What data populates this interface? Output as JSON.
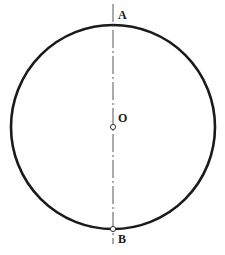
{
  "diagram": {
    "type": "circle-with-diameter",
    "circle": {
      "cx": 113,
      "cy": 127,
      "r": 102,
      "stroke": "#1a1a1a",
      "stroke_width": 2.6
    },
    "axis": {
      "x": 113,
      "y1": 4,
      "y2": 244,
      "stroke": "#555555",
      "style": "dash-dot"
    },
    "points": [
      {
        "id": "A",
        "label": "A",
        "x": 113,
        "y": 25,
        "marker": false
      },
      {
        "id": "O",
        "label": "O",
        "x": 113,
        "y": 127,
        "marker": true
      },
      {
        "id": "B",
        "label": "B",
        "x": 113,
        "y": 229,
        "marker": true
      }
    ]
  },
  "labels": {
    "a": "A",
    "o": "O",
    "b": "B"
  }
}
